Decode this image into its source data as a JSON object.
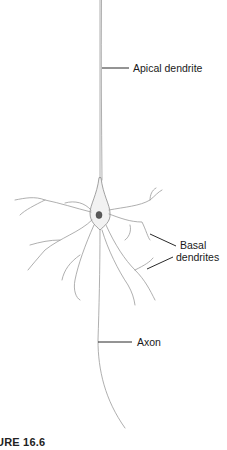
{
  "diagram": {
    "labels": {
      "apical_dendrite": "Apical dendrite",
      "basal_dendrites_line1": "Basal",
      "basal_dendrites_line2": "dendrites",
      "axon": "Axon"
    },
    "caption": "URE 16.6"
  }
}
